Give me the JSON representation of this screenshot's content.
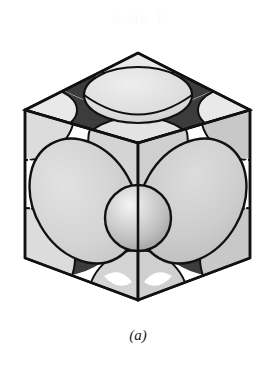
{
  "figure": {
    "caption": "(a)",
    "ghost_text": "a  mu     1",
    "type": "crystal-unit-cell",
    "canvas": {
      "width": 276,
      "height": 365
    }
  },
  "colors": {
    "background": "#ffffff",
    "outline": "#111111",
    "sphere_light": "#d8d8d8",
    "sphere_mid": "#c6c6c6",
    "sphere_dark": "#b0b0b0",
    "face_top": "#f2f2f2",
    "face_left": "#ededed",
    "face_right": "#b8b8b8",
    "interstice_dark": "#3a3a3a",
    "interstice_mid": "#606060",
    "highlight": "#f0f0f0",
    "caption_text": "#1a1a1a",
    "ghost": "#fbfbfb"
  },
  "geometry": {
    "vertices": {
      "top_apex": [
        138,
        15
      ],
      "left": [
        25,
        72
      ],
      "right": [
        250,
        72
      ],
      "front": [
        138,
        105
      ],
      "bottom_apex": [
        138,
        262
      ],
      "lower_left": [
        25,
        220
      ],
      "lower_right": [
        250,
        220
      ],
      "back_top": [
        138,
        15
      ]
    },
    "center_sphere": {
      "cx": 138,
      "cy": 180,
      "r": 33
    },
    "top_face_center_ellipse": {
      "cx": 138,
      "cy": 56,
      "rx": 53,
      "ry": 27
    },
    "left_face_center_ellipse": {
      "cx": 84,
      "cy": 163,
      "rx": 52,
      "ry": 66,
      "rotate": -28
    },
    "right_face_center_ellipse": {
      "cx": 192,
      "cy": 163,
      "rx": 52,
      "ry": 66,
      "rotate": 28
    }
  },
  "labels": {
    "structure": "FCC",
    "parts": [
      {
        "name": "top-face",
        "description": "top face of cube"
      },
      {
        "name": "left-front-face",
        "description": "left front face of cube"
      },
      {
        "name": "right-front-face",
        "description": "right front face of cube"
      },
      {
        "name": "center-atom",
        "description": "front face-center atom sphere"
      },
      {
        "name": "corner-atoms",
        "description": "corner atoms shown as partial spheres"
      },
      {
        "name": "face-center-atoms",
        "description": "face centered atoms shown as ellipses"
      }
    ]
  }
}
